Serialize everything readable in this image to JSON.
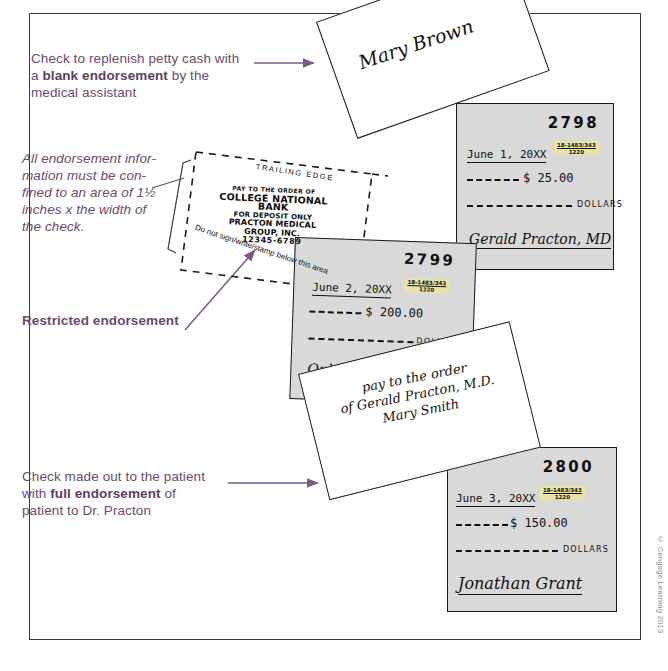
{
  "figure": {
    "credit": "© Cengage Learning 2013"
  },
  "callouts": {
    "top": {
      "part1": "Check to replenish petty cash with a ",
      "bold": "blank endorsement",
      "part2": " by the medical assistant"
    },
    "middle_italic": "All endorsement infor-mation must be con-fined to an area of 1½ inches x the width of the check.",
    "middle_italic_lines": [
      "All endorsement infor-",
      "mation must be con-",
      "fined to an area of 1½",
      "inches x the width of",
      "the check."
    ],
    "restricted": "Restricted endorsement",
    "bottom": {
      "part1": "Check made out to the patient with ",
      "bold": "full endorsement",
      "part2": " of patient to Dr. Practon"
    }
  },
  "blank_endorsement_check": {
    "signature": "Mary Brown"
  },
  "back_of_check": {
    "trailing_edge_label": "TRAILING EDGE",
    "stamp": {
      "line1": "PAY TO THE ORDER OF",
      "line2": "COLLEGE NATIONAL BANK",
      "line3": "FOR DEPOSIT ONLY",
      "line4": "PRACTON MEDICAL GROUP, INC.",
      "line5": "12345-6789"
    },
    "warning": "Do not sign/write/stamp below this area"
  },
  "full_endorsement_check": {
    "line1": "pay to the order",
    "line2": "of Gerald Practon, M.D.",
    "line3": "Mary Smith"
  },
  "checks": [
    {
      "number": "2798",
      "date": "June 1, 20XX",
      "fraction_top": "18-1483/343",
      "fraction_bottom": "1220",
      "amount": "$ 25.00",
      "dollars_label": "DOLLARS",
      "signature": "Gerald Practon, MD"
    },
    {
      "number": "2799",
      "date": "June 2, 20XX",
      "fraction_top": "18-1483/343",
      "fraction_bottom": "1220",
      "amount": "$ 200.00",
      "dollars_label": "DOLLARS",
      "signature": "Ophelia D Smith"
    },
    {
      "number": "2800",
      "date": "June 3, 20XX",
      "fraction_top": "18-1483/343",
      "fraction_bottom": "1220",
      "amount": "$ 150.00",
      "dollars_label": "DOLLARS",
      "signature": "Jonathan Grant"
    }
  ],
  "colors": {
    "callout_purple": "#6b4a73",
    "check_gray": "#d9d9d9",
    "highlight_yellow": "#e8e4a8"
  }
}
